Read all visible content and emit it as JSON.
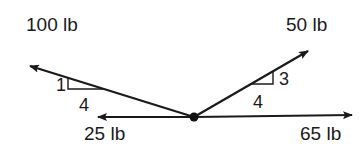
{
  "diagram": {
    "type": "force-diagram",
    "origin": {
      "x": 194,
      "y": 117
    },
    "colors": {
      "stroke": "#1a1a1a",
      "background": "#ffffff"
    },
    "forces": [
      {
        "id": "f100",
        "label": "100 lb",
        "magnitude": 100,
        "unit": "lb",
        "direction": "up-left",
        "slope": {
          "rise": 1,
          "run": 4
        }
      },
      {
        "id": "f50",
        "label": "50 lb",
        "magnitude": 50,
        "unit": "lb",
        "direction": "up-right",
        "slope": {
          "rise": 3,
          "run": 4
        }
      },
      {
        "id": "f25",
        "label": "25 lb",
        "magnitude": 25,
        "unit": "lb",
        "direction": "left"
      },
      {
        "id": "f65",
        "label": "65 lb",
        "magnitude": 65,
        "unit": "lb",
        "direction": "right"
      }
    ],
    "slope_labels": {
      "left_rise": "1",
      "left_run": "4",
      "right_rise": "3",
      "right_run": "4"
    }
  }
}
